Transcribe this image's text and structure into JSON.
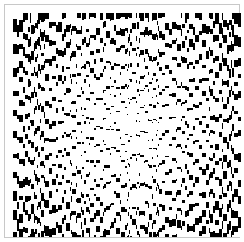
{
  "document": {
    "title": "Vertical Line-Screen Dither Halftone",
    "caption": "",
    "background_color": "#ffffff"
  },
  "frame": {
    "border_color": "#c8c8c8",
    "border_width_px": 1,
    "inset_px": 4,
    "width_px": 236,
    "height_px": 234
  },
  "canvas": {
    "x_px": 8,
    "y_px": 8,
    "width_px": 228,
    "height_px": 224,
    "ink_color": "#000000",
    "paper_color": "#ffffff"
  },
  "chart_data": {
    "type": "heatmap",
    "subtitle": "",
    "xlabel": "",
    "ylabel": "",
    "legend": [],
    "grid": false,
    "render_mode": "vertical-line-screen",
    "x": [
      0,
      228
    ],
    "y": [
      0,
      224
    ],
    "xlim": [
      0,
      228
    ],
    "ylim": [
      0,
      224
    ],
    "gradient": {
      "model": "elliptical-radial",
      "center_x": 0.5,
      "center_y": 0.5,
      "radius_x": 0.62,
      "radius_y": 0.6,
      "center_luminance": 0.99,
      "edge_luminance": 0.12,
      "corner_luminance": 0.05,
      "falloff_exponent": 1.65
    },
    "screen": {
      "column_min_width_px": 1,
      "column_max_width_px": 4,
      "column_mean_width_px": 2.1,
      "run_min_length_px": 1,
      "run_max_length_px": 26,
      "jitter": 0.45,
      "seed": 20240517
    },
    "sampled_density": {
      "note": "fraction of black ink measured in sampled patches, 0 = white, 1 = solid black",
      "points": [
        {
          "x": 0.05,
          "y": 0.05,
          "density": 0.62
        },
        {
          "x": 0.25,
          "y": 0.05,
          "density": 0.55
        },
        {
          "x": 0.5,
          "y": 0.05,
          "density": 0.48
        },
        {
          "x": 0.75,
          "y": 0.05,
          "density": 0.55
        },
        {
          "x": 0.95,
          "y": 0.05,
          "density": 0.63
        },
        {
          "x": 0.05,
          "y": 0.25,
          "density": 0.56
        },
        {
          "x": 0.25,
          "y": 0.25,
          "density": 0.4
        },
        {
          "x": 0.5,
          "y": 0.25,
          "density": 0.26
        },
        {
          "x": 0.75,
          "y": 0.25,
          "density": 0.39
        },
        {
          "x": 0.95,
          "y": 0.25,
          "density": 0.57
        },
        {
          "x": 0.05,
          "y": 0.5,
          "density": 0.52
        },
        {
          "x": 0.25,
          "y": 0.5,
          "density": 0.3
        },
        {
          "x": 0.5,
          "y": 0.5,
          "density": 0.06
        },
        {
          "x": 0.75,
          "y": 0.5,
          "density": 0.29
        },
        {
          "x": 0.95,
          "y": 0.5,
          "density": 0.53
        },
        {
          "x": 0.05,
          "y": 0.75,
          "density": 0.57
        },
        {
          "x": 0.25,
          "y": 0.75,
          "density": 0.41
        },
        {
          "x": 0.5,
          "y": 0.75,
          "density": 0.27
        },
        {
          "x": 0.75,
          "y": 0.75,
          "density": 0.4
        },
        {
          "x": 0.95,
          "y": 0.75,
          "density": 0.58
        },
        {
          "x": 0.05,
          "y": 0.95,
          "density": 0.64
        },
        {
          "x": 0.25,
          "y": 0.95,
          "density": 0.57
        },
        {
          "x": 0.5,
          "y": 0.95,
          "density": 0.5
        },
        {
          "x": 0.75,
          "y": 0.95,
          "density": 0.56
        },
        {
          "x": 0.95,
          "y": 0.95,
          "density": 0.65
        }
      ]
    }
  }
}
